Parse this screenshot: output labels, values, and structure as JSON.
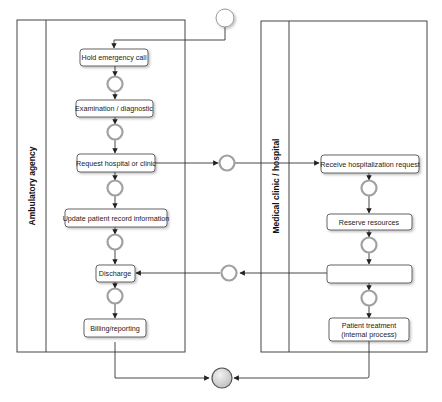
{
  "diagram": {
    "type": "BPMN collaboration",
    "pools": [
      {
        "id": "ambulatory",
        "label": "Ambulatory  agency",
        "tasks": [
          {
            "id": "t1",
            "label": "Hold emergency call"
          },
          {
            "id": "t2",
            "label": "Examination / diagnostic"
          },
          {
            "id": "t3",
            "label": "Request hospital or clinic"
          },
          {
            "id": "t4",
            "label": "Update patient record information"
          },
          {
            "id": "t5",
            "label": "Discharge"
          },
          {
            "id": "t6",
            "label": "Billing/reporting"
          }
        ]
      },
      {
        "id": "hospital",
        "label": "Medical clinic / hospital",
        "tasks": [
          {
            "id": "h1",
            "label": "Receive hospitalization request"
          },
          {
            "id": "h2",
            "label": "Reserve  resources"
          },
          {
            "id": "h3",
            "label": "Patient admission"
          },
          {
            "id": "h4_line1",
            "label": "Patient treatment"
          },
          {
            "id": "h4_line2",
            "label": "(internal process)"
          }
        ]
      }
    ],
    "events": {
      "start": "start-event",
      "end": "end-event",
      "intermediate_count": 9
    },
    "colors": {
      "stroke": "#444444",
      "task_fill": "#ffffff",
      "event_ring": "#9a9a9a",
      "end_fill": "#d8d8d8"
    }
  }
}
